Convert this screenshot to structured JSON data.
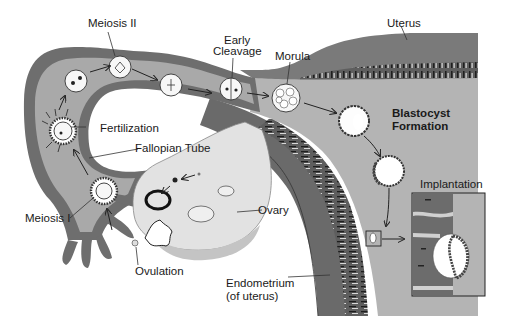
{
  "labels": {
    "meiosis_ii": "Meiosis II",
    "early_cleavage_line1": "Early",
    "early_cleavage_line2": "Cleavage",
    "morula": "Morula",
    "uterus": "Uterus",
    "fertilization": "Fertilization",
    "fallopian_tube": "Fallopian Tube",
    "blastocyst_line1": "Blastocyst",
    "blastocyst_line2": "Formation",
    "implantation": "Implantation",
    "meiosis_i": "Meiosis I",
    "ovary": "Ovary",
    "ovulation": "Ovulation",
    "endometrium_line1": "Endometrium",
    "endometrium_line2": "(of uterus)"
  },
  "stages": [
    "Ovulation",
    "Meiosis I",
    "Fertilization",
    "Meiosis II",
    "Early Cleavage",
    "Morula",
    "Blastocyst Formation",
    "Implantation"
  ],
  "colors": {
    "tube_wall": "#6e6e6e",
    "tube_lumen": "#a9a9a9",
    "uterine_cavity": "#b4b4b4",
    "uterus_wall": "#7a7a7a",
    "endometrium": "#5c5c5c",
    "ovary": "#e2e2e2",
    "cell": "#f7f7f7",
    "background": "#ffffff"
  }
}
